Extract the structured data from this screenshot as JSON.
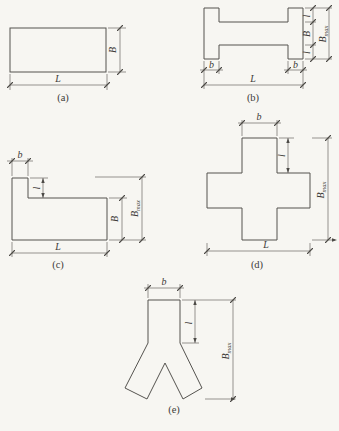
{
  "dim_labels": {
    "length": "L",
    "width": "B",
    "tab_width": "b",
    "tab_depth": "l",
    "max_width": {
      "base": "B",
      "sub": "max"
    }
  },
  "captions": {
    "a": "(a)",
    "b": "(b)",
    "c": "(c)",
    "d": "(d)",
    "e": "(e)"
  },
  "colors": {
    "paper": "#f7f6f2",
    "line": "#55534f",
    "ink": "#3d3b38"
  }
}
